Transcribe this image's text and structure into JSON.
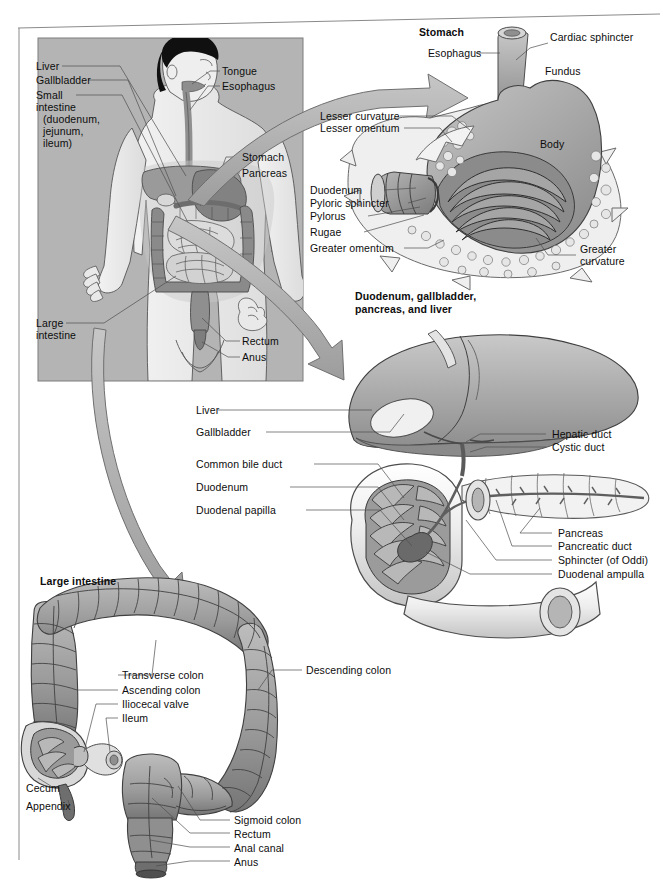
{
  "figure": {
    "panels": [
      {
        "id": "body",
        "heading": null
      },
      {
        "id": "stomach",
        "heading": "Stomach"
      },
      {
        "id": "duodenum",
        "heading": "Duodenum, gallbladder,\npancreas, and liver"
      },
      {
        "id": "large_intestine",
        "heading": "Large intestine"
      }
    ]
  },
  "headings": {
    "stomach": "Stomach",
    "duodenum_line1": "Duodenum, gallbladder,",
    "duodenum_line2": "pancreas, and liver",
    "large_intestine": "Large intestine"
  },
  "body_panel": {
    "labels_left": [
      {
        "text": "Liver"
      },
      {
        "text": "Gallbladder"
      },
      {
        "text": "Small"
      },
      {
        "text": "intestine"
      },
      {
        "text": "(duodenum,"
      },
      {
        "text": "jejunum,"
      },
      {
        "text": "ileum)"
      },
      {
        "text": "Large"
      },
      {
        "text": "intestine"
      }
    ],
    "labels_right": [
      {
        "text": "Tongue"
      },
      {
        "text": "Esophagus"
      },
      {
        "text": "Stomach"
      },
      {
        "text": "Pancreas"
      },
      {
        "text": "Rectum"
      },
      {
        "text": "Anus"
      }
    ]
  },
  "stomach_panel": {
    "labels_left": [
      {
        "text": "Esophagus"
      },
      {
        "text": "Lesser curvature"
      },
      {
        "text": "Lesser omentum"
      },
      {
        "text": "Duodenum"
      },
      {
        "text": "Pyloric sphincter"
      },
      {
        "text": "Pylorus"
      },
      {
        "text": "Rugae"
      },
      {
        "text": "Greater omentum"
      }
    ],
    "labels_right": [
      {
        "text": "Cardiac sphincter"
      },
      {
        "text": "Fundus"
      },
      {
        "text": "Body"
      },
      {
        "text": "Greater"
      },
      {
        "text": "curvature"
      }
    ]
  },
  "duodenum_panel": {
    "labels_left": [
      {
        "text": "Liver"
      },
      {
        "text": "Gallbladder"
      },
      {
        "text": "Common bile duct"
      },
      {
        "text": "Duodenum"
      },
      {
        "text": "Duodenal papilla"
      }
    ],
    "labels_right": [
      {
        "text": "Hepatic duct"
      },
      {
        "text": "Cystic duct"
      },
      {
        "text": "Pancreas"
      },
      {
        "text": "Pancreatic duct"
      },
      {
        "text": "Sphincter (of Oddi)"
      },
      {
        "text": "Duodenal ampulla"
      }
    ]
  },
  "large_intestine_panel": {
    "labels_center": [
      {
        "text": "Transverse colon"
      },
      {
        "text": "Ascending colon"
      },
      {
        "text": "Iliocecal valve"
      },
      {
        "text": "Ileum"
      },
      {
        "text": "Cecum"
      },
      {
        "text": "Appendix"
      },
      {
        "text": "Sigmoid colon"
      },
      {
        "text": "Rectum"
      },
      {
        "text": "Anal canal"
      },
      {
        "text": "Anus"
      }
    ],
    "labels_right": [
      {
        "text": "Descending colon"
      }
    ]
  },
  "colors": {
    "page_background": "#ffffff",
    "frame_line": "#8a8a8a",
    "body_box_fill": "#b4b4b4",
    "body_skin": "#e8e8e8",
    "hair_black": "#101010",
    "organ_dark": "#6e6e6e",
    "organ_mid": "#9a9a9a",
    "organ_light": "#d2d2d2",
    "organ_pale": "#ececec",
    "arrow_fill": "#b0b0b0",
    "arrow_stroke": "#6f6f6f",
    "leader_line": "#5a5a5a",
    "text": "#0d0d0d"
  }
}
